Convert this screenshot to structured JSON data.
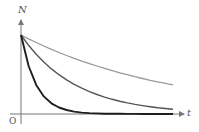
{
  "chart_data": {
    "type": "line",
    "title": "",
    "xlabel": "t",
    "ylabel": "N",
    "origin_label": "O",
    "grid": false,
    "legend": null,
    "xlim": [
      0,
      10
    ],
    "ylim": [
      0,
      1
    ],
    "x": [
      0,
      0.5,
      1,
      1.5,
      2,
      2.5,
      3,
      3.5,
      4,
      4.5,
      5,
      5.5,
      6,
      6.5,
      7,
      7.5,
      8,
      8.5,
      9,
      9.5,
      10
    ],
    "series": [
      {
        "name": "slow decay",
        "color": "#9a9a9a",
        "width": 1.3,
        "values": [
          1.0,
          0.951,
          0.905,
          0.861,
          0.819,
          0.779,
          0.741,
          0.705,
          0.67,
          0.638,
          0.607,
          0.577,
          0.549,
          0.522,
          0.497,
          0.472,
          0.449,
          0.427,
          0.407,
          0.387,
          0.368
        ]
      },
      {
        "name": "medium decay",
        "color": "#555555",
        "width": 1.4,
        "values": [
          1.0,
          0.869,
          0.756,
          0.657,
          0.571,
          0.497,
          0.432,
          0.375,
          0.326,
          0.284,
          0.247,
          0.214,
          0.186,
          0.162,
          0.141,
          0.122,
          0.106,
          0.093,
          0.08,
          0.07,
          0.061
        ]
      },
      {
        "name": "fast decay",
        "color": "#1e1e1e",
        "width": 1.9,
        "values": [
          1.0,
          0.607,
          0.368,
          0.223,
          0.135,
          0.082,
          0.05,
          0.03,
          0.018,
          0.011,
          0.007,
          0.004,
          0.002,
          0.002,
          0.001,
          0.001,
          0.0,
          0.0,
          0.0,
          0.0,
          0.0
        ]
      }
    ]
  }
}
